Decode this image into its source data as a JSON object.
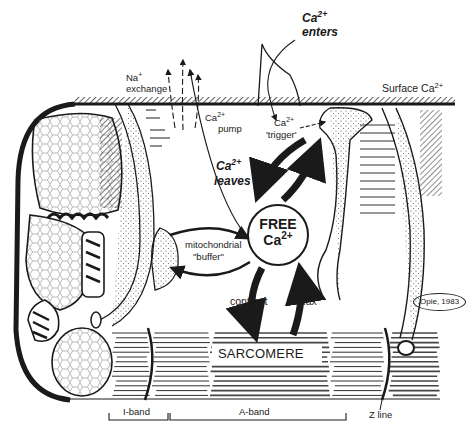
{
  "figure": {
    "credit": "Opie, 1983",
    "colors": {
      "ink": "#1a1a1a",
      "paper": "#ffffff",
      "stipple": "#555555"
    }
  },
  "labels": {
    "ca_enters": {
      "base": "Ca",
      "sup": "2+",
      "line2": "enters"
    },
    "surface_ca": {
      "base": "Surface Ca",
      "sup": "2+"
    },
    "na_exchange": {
      "line1": "Na",
      "sup": "+",
      "line2": "exchange"
    },
    "ca_pump": {
      "base": "Ca",
      "sup": "2+",
      "line2": "pump"
    },
    "ca_trigger": {
      "base": "Ca",
      "sup": "2+",
      "line2": "'trigger'"
    },
    "ca_leaves": {
      "base": "Ca",
      "sup": "2+",
      "line2": "leaves"
    },
    "free_ca": {
      "line1": "FREE",
      "base": "Ca",
      "sup": "2+"
    },
    "mito_buffer": {
      "line1": "mitochondrial",
      "line2": "\"buffer\""
    },
    "contract": "contract",
    "relax": "relax",
    "sarcomere": "SARCOMERE",
    "i_band": "I-band",
    "a_band": "A-band",
    "z_line": "Z line"
  }
}
